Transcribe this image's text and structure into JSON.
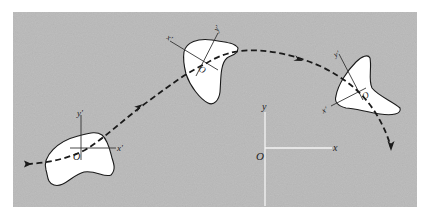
{
  "figure": {
    "background_color": "#b9b9b9",
    "body_color": "#ffffff",
    "outline_color": "#1a1a1a",
    "path_style": "dashed",
    "fixed_frame": {
      "origin_label": "O",
      "x_label": "x",
      "y_label": "y"
    },
    "bodies": [
      {
        "position": "left",
        "origin_label": "O",
        "x_label": "x'",
        "y_label": "y'"
      },
      {
        "position": "middle",
        "origin_label": "O",
        "x_label": "x'",
        "y_label": "y'"
      },
      {
        "position": "right",
        "origin_label": "O",
        "x_label": "x'",
        "y_label": "y'"
      }
    ],
    "arrows": [
      "start-arrow",
      "mid-arrow-1",
      "mid-arrow-2",
      "end-arrow"
    ]
  }
}
